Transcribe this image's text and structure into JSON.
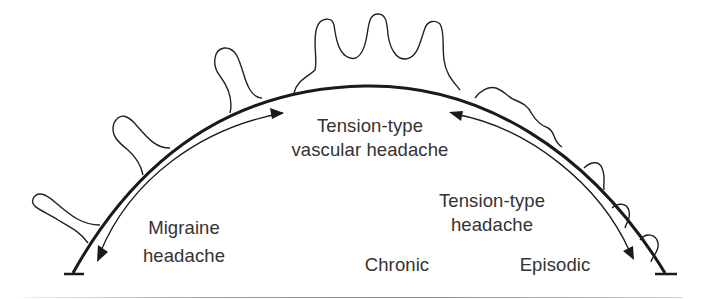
{
  "diagram": {
    "title": "",
    "colors": {
      "line": "#1a1a1a",
      "text": "#333333",
      "background": "#ffffff"
    },
    "labels": {
      "tension_vascular": {
        "line1": "Tension-type",
        "line2": "vascular headache"
      },
      "migraine": {
        "line1": "Migraine",
        "line2": "headache"
      },
      "tension_type": {
        "line1": "Tension-type",
        "line2": "headache"
      },
      "chronic": "Chronic",
      "episodic": "Episodic"
    },
    "arrows": [
      {
        "from": "Tension-type vascular headache",
        "to": "Migraine headache",
        "bidirectional": true
      },
      {
        "from": "Tension-type vascular headache",
        "to": "Tension-type headache",
        "bidirectional": true
      }
    ],
    "spectrum": {
      "left_end": "Migraine headache",
      "center": "Tension-type vascular headache",
      "right_end": "Tension-type headache",
      "axis_labels": [
        "Chronic",
        "Episodic"
      ]
    }
  }
}
